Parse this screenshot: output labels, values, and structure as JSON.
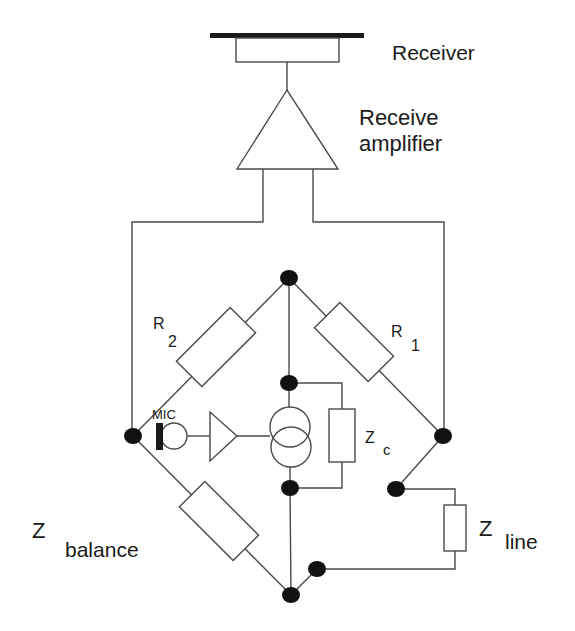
{
  "diagram": {
    "colors": {
      "line": "#4a4a4a",
      "node": "#111111",
      "text": "#1a1a1a",
      "background": "#ffffff"
    },
    "labels": {
      "receiver": "Receiver",
      "receive_amp_line1": "Receive",
      "receive_amp_line2": "amplifier",
      "r2_main": "R",
      "r2_sub": "2",
      "r1_main": "R",
      "r1_sub": "1",
      "mic": "MIC",
      "zc_main": "Z",
      "zc_sub": "c",
      "zbalance_main": "Z",
      "zbalance_sub": "balance",
      "zline_main": "Z",
      "zline_sub": "line"
    },
    "components": [
      "receiver",
      "receive-amplifier",
      "resistor-R1",
      "resistor-R2",
      "microphone",
      "mic-amplifier",
      "transformer",
      "impedance-Zc",
      "impedance-Zbalance",
      "impedance-Zline"
    ]
  }
}
